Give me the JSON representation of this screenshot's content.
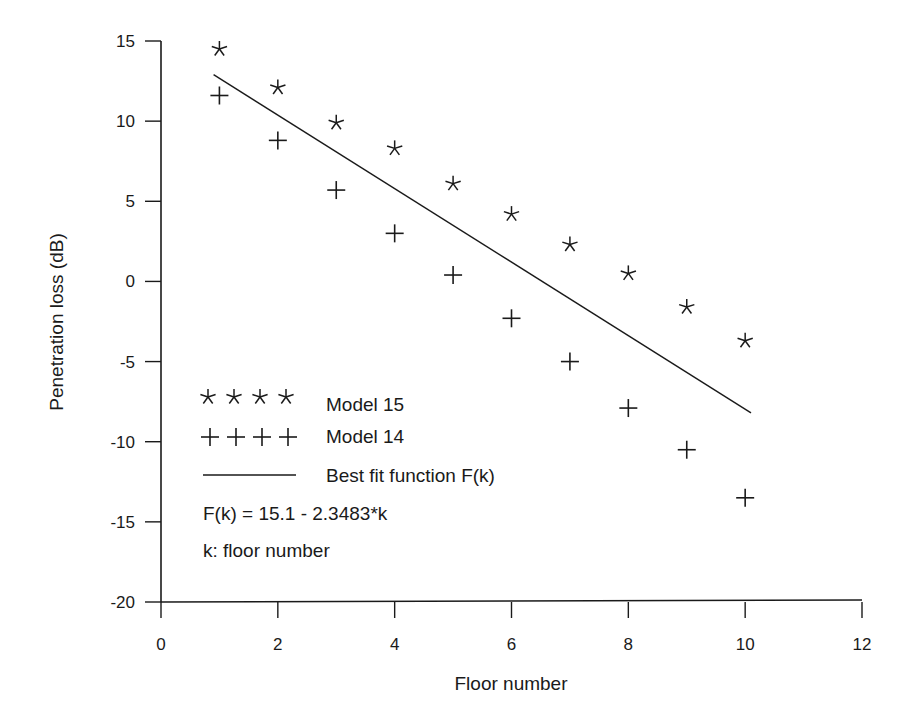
{
  "chart_data": {
    "type": "scatter",
    "title": "",
    "xlabel": "Floor number",
    "ylabel": "Penetration loss (dB)",
    "xlim": [
      0,
      12
    ],
    "ylim": [
      -20,
      15
    ],
    "x_ticks": [
      0,
      2,
      4,
      6,
      8,
      10,
      12
    ],
    "y_ticks": [
      15,
      10,
      5,
      0,
      -5,
      -10,
      -15,
      -20
    ],
    "grid": false,
    "legend_position": "lower left (inside)",
    "series": [
      {
        "name": "Model 15",
        "marker": "star",
        "x": [
          1,
          2,
          3,
          4,
          5,
          6,
          7,
          8,
          9,
          10
        ],
        "values": [
          14.5,
          12.1,
          9.9,
          8.3,
          6.1,
          4.2,
          2.3,
          0.5,
          -1.6,
          -3.7
        ]
      },
      {
        "name": "Model 14",
        "marker": "plus",
        "x": [
          1,
          2,
          3,
          4,
          5,
          6,
          7,
          8,
          9,
          10
        ],
        "values": [
          11.6,
          8.8,
          5.7,
          3.0,
          0.4,
          -2.3,
          -5.0,
          -7.9,
          -10.5,
          -13.5
        ]
      },
      {
        "name": "Best fit function F(k)",
        "marker": "line",
        "x": [
          0.9,
          10.1
        ],
        "values": [
          12.9,
          -8.2
        ]
      }
    ],
    "annotations": [
      "F(k) = 15.1 - 2.3483*k",
      "k: floor number"
    ]
  },
  "legend": {
    "model15_symbol": "* * * *",
    "model15_label": "Model 15",
    "model14_symbol": "+ + + +",
    "model14_label": "Model 14",
    "fit_label": "Best fit function F(k)",
    "formula": "F(k) = 15.1 - 2.3483*k",
    "k_note": "k: floor number"
  },
  "colors": {
    "ink": "#1a1a1a",
    "background": "#ffffff"
  }
}
